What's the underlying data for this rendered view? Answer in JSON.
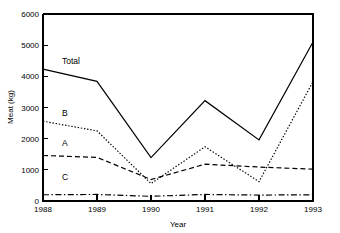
{
  "chart_data": {
    "type": "line",
    "title": "",
    "xlabel": "Year",
    "ylabel": "Meat (kg)",
    "x": [
      1988,
      1989,
      1990,
      1991,
      1992,
      1993
    ],
    "xticklabels": [
      "1988",
      "1989",
      "1990",
      "1991",
      "1992",
      "1993"
    ],
    "yticks": [
      0,
      1000,
      2000,
      3000,
      4000,
      5000,
      6000
    ],
    "yticklabels": [
      "0",
      "1000",
      "2000",
      "3000",
      "4000",
      "5000",
      "6000"
    ],
    "ylim": [
      0,
      6000
    ],
    "xlim": [
      1988,
      1993
    ],
    "grid": false,
    "legend": "inline-labels",
    "series": [
      {
        "name": "Total",
        "label": "Total",
        "linestyle": "solid",
        "color": "#000000",
        "values": [
          4230,
          3840,
          1390,
          3220,
          1960,
          5100
        ]
      },
      {
        "name": "B",
        "label": "B",
        "linestyle": "dotted",
        "color": "#000000",
        "values": [
          2560,
          2250,
          560,
          1740,
          620,
          3830
        ]
      },
      {
        "name": "A",
        "label": "A",
        "linestyle": "dashed",
        "color": "#000000",
        "values": [
          1460,
          1400,
          690,
          1180,
          1090,
          1020
        ]
      },
      {
        "name": "C",
        "label": "C",
        "linestyle": "dashdot",
        "color": "#000000",
        "values": [
          200,
          210,
          150,
          210,
          190,
          200
        ]
      }
    ]
  },
  "labels": {
    "total": "Total",
    "b": "B",
    "a": "A",
    "c": "C"
  },
  "axis": {
    "y_title": "Meat (kg)",
    "x_title": "Year",
    "y_0": "0",
    "y_1000": "1000",
    "y_2000": "2000",
    "y_3000": "3000",
    "y_4000": "4000",
    "y_5000": "5000",
    "y_6000": "6000",
    "x_1988": "1988",
    "x_1989": "1989",
    "x_1990": "1990",
    "x_1991": "1991",
    "x_1992": "1992",
    "x_1993": "1993"
  }
}
